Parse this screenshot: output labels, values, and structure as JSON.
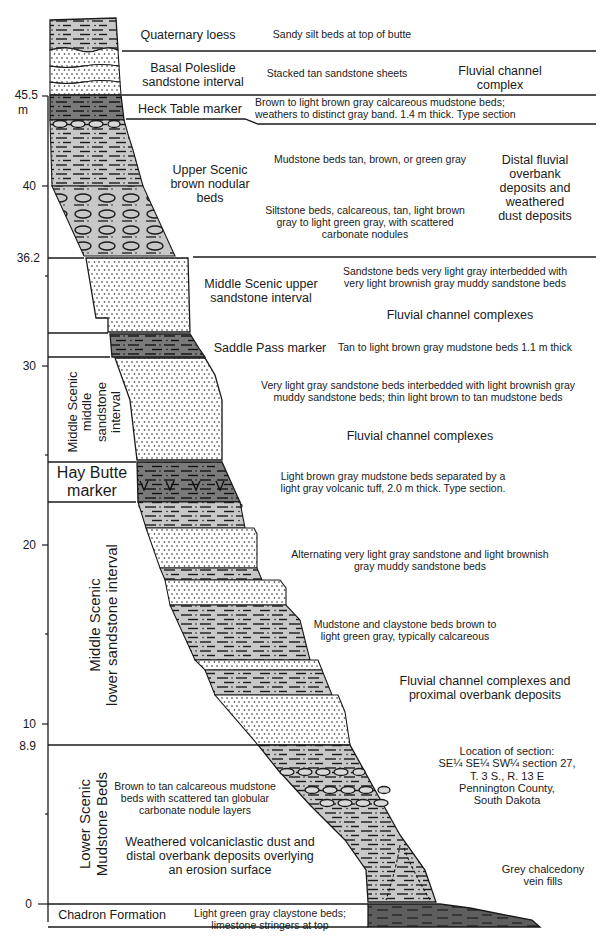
{
  "axis": {
    "unit": "m",
    "ticks": [
      {
        "label": "45.5",
        "y": 96
      },
      {
        "label": "40",
        "y": 186
      },
      {
        "label": "36.2",
        "y": 258
      },
      {
        "label": "30",
        "y": 366
      },
      {
        "label": "20",
        "y": 545
      },
      {
        "label": "10",
        "y": 724
      },
      {
        "label": "8.9",
        "y": 745
      },
      {
        "label": "0",
        "y": 904
      }
    ]
  },
  "units": [
    {
      "id": "quaternary-loess",
      "name": "Quaternary loess",
      "description": "Sandy silt beds at top of butte"
    },
    {
      "id": "basal-poleslide",
      "name": "Basal Poleslide\nsandstone interval",
      "description": "Stacked tan sandstone sheets",
      "interpretation": "Fluvial channel\ncomplex"
    },
    {
      "id": "heck-table-marker",
      "name": "Heck Table marker",
      "description": "Brown to light brown gray calcareous mudstone beds;\nweathers to distinct gray band. 1.4 m thick. Type section"
    },
    {
      "id": "upper-scenic-brown-nodular",
      "name": "Upper Scenic\nbrown nodular\nbeds",
      "description_upper": "Mudstone beds tan, brown, or green gray",
      "description_lower": "Siltstone beds, calcareous, tan, light brown\ngray to light green gray, with scattered\ncarbonate nodules",
      "interpretation": "Distal fluvial\noverbank\ndeposits and\nweathered\ndust deposits"
    },
    {
      "id": "middle-scenic-upper-sandstone",
      "name": "Middle Scenic upper\nsandstone interval",
      "description": "Sandstone beds very light gray interbedded with\nvery light brownish gray muddy sandstone beds",
      "interpretation": "Fluvial channel complexes"
    },
    {
      "id": "saddle-pass-marker",
      "name": "Saddle Pass marker",
      "description": "Tan to light brown gray mudstone beds 1.1 m thick"
    },
    {
      "id": "middle-scenic-middle-sandstone",
      "name": "Middle Scenic\nmiddle\nsandstone\ninterval",
      "description": "Very light gray sandstone beds interbedded with light brownish gray\nmuddy sandstone beds; thin light brown to tan mudstone beds",
      "interpretation": "Fluvial channel complexes"
    },
    {
      "id": "hay-butte-marker",
      "name": "Hay Butte\nmarker",
      "description": "Light brown gray mudstone beds separated by a\nlight gray volcanic tuff, 2.0 m thick.  Type section."
    },
    {
      "id": "middle-scenic-lower-sandstone",
      "name": "Middle Scenic\nlower sandstone interval",
      "description_upper": "Alternating very light gray sandstone and light brownish\ngray muddy sandstone beds",
      "description_lower": "Mudstone and claystone beds brown to\nlight green gray, typically calcareous",
      "interpretation": "Fluvial channel complexes and\nproximal overbank deposits"
    },
    {
      "id": "lower-scenic-mudstone",
      "name": "Lower Scenic\nMudstone Beds",
      "description": "Brown to tan calcareous mudstone\nbeds with scattered tan globular\ncarbonate nodule layers",
      "interpretation": "Weathered volcaniclastic dust and\ndistal overbank deposits overlying\nan erosion surface"
    },
    {
      "id": "chadron-formation",
      "name": "Chadron Formation",
      "description": "Light green gray claystone beds;\nlimestone stringers at top"
    }
  ],
  "annotations": {
    "location": "Location of section:\nSE¼ SE¼ SW¼ section 27,\nT. 3 S., R. 13 E\nPennington County,\nSouth Dakota",
    "chalcedony": "Grey chalcedony\nvein fills"
  },
  "colors": {
    "light_gray": "#c8c8c8",
    "dark_gray": "#7a7a7a",
    "chadron": "#5e5e5e",
    "sandstone": "#ffffff",
    "line": "#1a1a1a"
  }
}
